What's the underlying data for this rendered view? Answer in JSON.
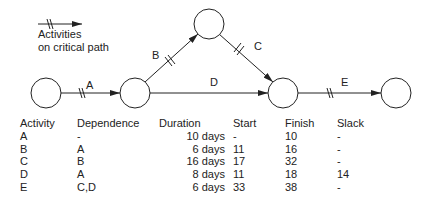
{
  "legend": {
    "line1": "Activities",
    "line2": "on critical path"
  },
  "network": {
    "nodes": [
      {
        "id": "n1",
        "cx": 46,
        "cy": 93
      },
      {
        "id": "n2",
        "cx": 135,
        "cy": 93
      },
      {
        "id": "n3",
        "cx": 209,
        "cy": 24
      },
      {
        "id": "n4",
        "cx": 283,
        "cy": 93
      },
      {
        "id": "n5",
        "cx": 396,
        "cy": 93
      }
    ],
    "edges": [
      {
        "label": "A",
        "from": "n1",
        "to": "n2",
        "critical": true
      },
      {
        "label": "B",
        "from": "n2",
        "to": "n3",
        "critical": true
      },
      {
        "label": "C",
        "from": "n3",
        "to": "n4",
        "critical": true
      },
      {
        "label": "D",
        "from": "n2",
        "to": "n4",
        "critical": false
      },
      {
        "label": "E",
        "from": "n4",
        "to": "n5",
        "critical": true
      }
    ]
  },
  "table": {
    "headers": [
      "Activity",
      "Dependence",
      "Duration",
      "Start",
      "Finish",
      "Slack"
    ],
    "rows": [
      {
        "activity": "A",
        "dependence": "-",
        "duration": "10 days",
        "start": "-",
        "finish": "10",
        "slack": "-"
      },
      {
        "activity": "B",
        "dependence": "A",
        "duration": "6 days",
        "start": "11",
        "finish": "16",
        "slack": "-"
      },
      {
        "activity": "C",
        "dependence": "B",
        "duration": "16 days",
        "start": "17",
        "finish": "32",
        "slack": "-"
      },
      {
        "activity": "D",
        "dependence": "A",
        "duration": "8 days",
        "start": "11",
        "finish": "18",
        "slack": "14"
      },
      {
        "activity": "E",
        "dependence": "C,D",
        "duration": "6 days",
        "start": "33",
        "finish": "38",
        "slack": "-"
      }
    ]
  }
}
